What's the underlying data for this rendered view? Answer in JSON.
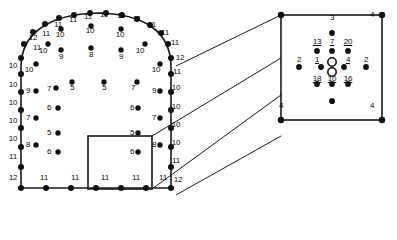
{
  "figure": {
    "name": "mesh-node-valence-diagram",
    "caption": "",
    "colors": {
      "stroke": "#1a1a1a",
      "node_fill": "#111111",
      "hollow_fill": "#ffffff",
      "background": "#ffffff",
      "text": "#0a0a0a"
    },
    "main_panel": {
      "name": "arch-cross-section",
      "boundary_labels": [
        {
          "text": "12",
          "x": 33,
          "y": 38
        },
        {
          "text": "11",
          "x": 37,
          "y": 48
        },
        {
          "text": "11",
          "x": 46,
          "y": 34
        },
        {
          "text": "11",
          "x": 58,
          "y": 25
        },
        {
          "text": "11",
          "x": 73,
          "y": 20
        },
        {
          "text": "11",
          "x": 88,
          "y": 17
        },
        {
          "text": "11",
          "x": 104,
          "y": 15
        },
        {
          "text": "11",
          "x": 121,
          "y": 16
        },
        {
          "text": "11",
          "x": 137,
          "y": 19
        },
        {
          "text": "11",
          "x": 152,
          "y": 25
        },
        {
          "text": "11",
          "x": 165,
          "y": 33
        },
        {
          "text": "11",
          "x": 175,
          "y": 43
        },
        {
          "text": "12",
          "x": 180,
          "y": 58
        },
        {
          "text": "11",
          "x": 177,
          "y": 72
        },
        {
          "text": "10",
          "x": 176,
          "y": 88
        },
        {
          "text": "10",
          "x": 176,
          "y": 107
        },
        {
          "text": "10",
          "x": 176,
          "y": 125
        },
        {
          "text": "10",
          "x": 176,
          "y": 143
        },
        {
          "text": "11",
          "x": 176,
          "y": 161
        },
        {
          "text": "12",
          "x": 178,
          "y": 180
        },
        {
          "text": "10",
          "x": 13,
          "y": 66
        },
        {
          "text": "10",
          "x": 13,
          "y": 85
        },
        {
          "text": "10",
          "x": 13,
          "y": 103
        },
        {
          "text": "10",
          "x": 13,
          "y": 121
        },
        {
          "text": "10",
          "x": 13,
          "y": 139
        },
        {
          "text": "11",
          "x": 13,
          "y": 157
        },
        {
          "text": "12",
          "x": 13,
          "y": 178
        },
        {
          "text": "11",
          "x": 44,
          "y": 178
        },
        {
          "text": "11",
          "x": 75,
          "y": 178
        },
        {
          "text": "11",
          "x": 105,
          "y": 178
        },
        {
          "text": "11",
          "x": 136,
          "y": 178
        },
        {
          "text": "11",
          "x": 163,
          "y": 178
        }
      ],
      "interior_labels": [
        {
          "text": "10",
          "x": 29,
          "y": 70
        },
        {
          "text": "9",
          "x": 28,
          "y": 91
        },
        {
          "text": "7",
          "x": 28,
          "y": 118
        },
        {
          "text": "8",
          "x": 28,
          "y": 145
        },
        {
          "text": "10",
          "x": 43,
          "y": 51
        },
        {
          "text": "7",
          "x": 49,
          "y": 89
        },
        {
          "text": "6",
          "x": 49,
          "y": 108
        },
        {
          "text": "5",
          "x": 49,
          "y": 133
        },
        {
          "text": "6",
          "x": 49,
          "y": 152
        },
        {
          "text": "10",
          "x": 60,
          "y": 35
        },
        {
          "text": "9",
          "x": 61,
          "y": 57
        },
        {
          "text": "5",
          "x": 72,
          "y": 88
        },
        {
          "text": "10",
          "x": 90,
          "y": 31
        },
        {
          "text": "8",
          "x": 91,
          "y": 55
        },
        {
          "text": "5",
          "x": 104,
          "y": 88
        },
        {
          "text": "10",
          "x": 120,
          "y": 35
        },
        {
          "text": "9",
          "x": 121,
          "y": 57
        },
        {
          "text": "7",
          "x": 133,
          "y": 88
        },
        {
          "text": "10",
          "x": 140,
          "y": 51
        },
        {
          "text": "6",
          "x": 132,
          "y": 108
        },
        {
          "text": "5",
          "x": 132,
          "y": 133
        },
        {
          "text": "6",
          "x": 132,
          "y": 152
        },
        {
          "text": "10",
          "x": 156,
          "y": 70
        },
        {
          "text": "9",
          "x": 154,
          "y": 91
        },
        {
          "text": "7",
          "x": 154,
          "y": 118
        },
        {
          "text": "8",
          "x": 154,
          "y": 145
        }
      ]
    },
    "detail_panel": {
      "name": "zoomed-node-valence-detail",
      "box": {
        "x": 149,
        "y": 7,
        "w": 103,
        "h": 106
      },
      "corner_labels": [
        {
          "text": "4",
          "x": 155,
          "y": 15
        },
        {
          "text": "4",
          "x": 246,
          "y": 15
        },
        {
          "text": "4",
          "x": 155,
          "y": 106
        },
        {
          "text": "4",
          "x": 246,
          "y": 106
        }
      ],
      "cluster_labels": [
        {
          "text": "3",
          "x": 200,
          "y": 18,
          "underline": false
        },
        {
          "text": "13",
          "x": 185,
          "y": 42,
          "underline": true
        },
        {
          "text": "7",
          "x": 200,
          "y": 42,
          "underline": true
        },
        {
          "text": "20",
          "x": 216,
          "y": 42,
          "underline": true
        },
        {
          "text": "2",
          "x": 167,
          "y": 60,
          "underline": false
        },
        {
          "text": "1",
          "x": 185,
          "y": 60,
          "underline": true
        },
        {
          "text": "4",
          "x": 216,
          "y": 60,
          "underline": true
        },
        {
          "text": "2",
          "x": 234,
          "y": 60,
          "underline": false
        },
        {
          "text": "18",
          "x": 185,
          "y": 79,
          "underline": true
        },
        {
          "text": "10",
          "x": 200,
          "y": 79,
          "underline": true
        },
        {
          "text": "16",
          "x": 216,
          "y": 79,
          "underline": true
        },
        {
          "text": "3",
          "x": 200,
          "y": 102,
          "underline": false
        }
      ]
    }
  }
}
